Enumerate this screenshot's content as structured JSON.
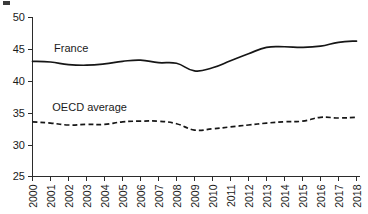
{
  "chart_data": {
    "type": "line",
    "title": "",
    "subtitle": "",
    "xlabel": "",
    "ylabel": "",
    "xlim": [
      2000,
      2018
    ],
    "ylim": [
      25,
      50
    ],
    "yticks": [
      25,
      30,
      35,
      40,
      45,
      50
    ],
    "grid": false,
    "legend_position": "inline-annotations",
    "x": [
      2000,
      2001,
      2002,
      2003,
      2004,
      2005,
      2006,
      2007,
      2008,
      2009,
      2010,
      2011,
      2012,
      2013,
      2014,
      2015,
      2016,
      2017,
      2018
    ],
    "categories": [
      "2000",
      "2001",
      "2002",
      "2003",
      "2004",
      "2005",
      "2006",
      "2007",
      "2008",
      "2009",
      "2010",
      "2011",
      "2012",
      "2013",
      "2014",
      "2015",
      "2016",
      "2017",
      "2018"
    ],
    "series": [
      {
        "name": "France",
        "style": "solid",
        "color": "#161616",
        "values": [
          43.1,
          43.0,
          42.6,
          42.5,
          42.7,
          43.1,
          43.3,
          42.9,
          42.8,
          41.6,
          42.1,
          43.2,
          44.3,
          45.3,
          45.4,
          45.3,
          45.5,
          46.1,
          46.3
        ]
      },
      {
        "name": "OECD average",
        "style": "dashed",
        "color": "#161616",
        "values": [
          33.6,
          33.4,
          33.1,
          33.2,
          33.2,
          33.6,
          33.7,
          33.7,
          33.3,
          32.3,
          32.5,
          32.8,
          33.1,
          33.4,
          33.6,
          33.7,
          34.3,
          34.2,
          34.3
        ]
      }
    ],
    "annotations": [
      {
        "text": "France",
        "x": 2001.2,
        "y": 44.6
      },
      {
        "text": "OECD average",
        "x": 2001.1,
        "y": 35.3
      }
    ]
  },
  "axis": {
    "y_tick_labels": [
      "50",
      "45",
      "40",
      "35",
      "30",
      "25"
    ],
    "x_tick_labels": [
      "2000",
      "2001",
      "2002",
      "2003",
      "2004",
      "2005",
      "2006",
      "2007",
      "2008",
      "2009",
      "2010",
      "2011",
      "2012",
      "2013",
      "2014",
      "2015",
      "2016",
      "2017",
      "2018"
    ]
  },
  "labels": {
    "france": "France",
    "oecd": "OECD average"
  }
}
